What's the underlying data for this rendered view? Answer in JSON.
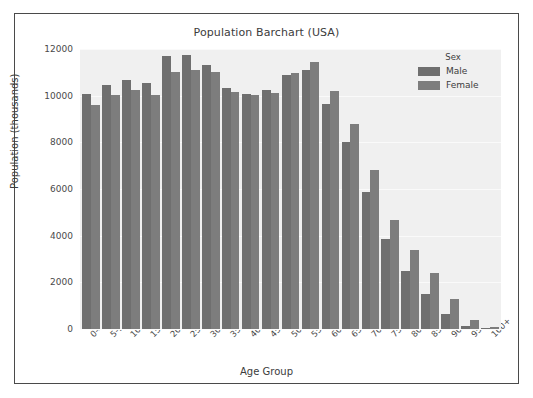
{
  "chart_data": {
    "type": "bar",
    "title": "Population Barchart (USA)",
    "xlabel": "Age Group",
    "ylabel": "Population (thousands)",
    "ylim": [
      0,
      12000
    ],
    "yticks": [
      0,
      2000,
      4000,
      6000,
      8000,
      10000,
      12000
    ],
    "ytick_labels": [
      "0",
      "2000",
      "4000",
      "6000",
      "8000",
      "10000",
      "12000"
    ],
    "grid": true,
    "legend": {
      "title": "Sex",
      "position": "upper right",
      "entries": [
        {
          "name": "Male",
          "color": "#6f6f6f"
        },
        {
          "name": "Female",
          "color": "#7d7d7d"
        }
      ]
    },
    "categories": [
      "0-4",
      "5-9",
      "10-14",
      "15-19",
      "20-24",
      "25-29",
      "30-34",
      "35-39",
      "40-44",
      "45-49",
      "50-54",
      "55-59",
      "60-64",
      "65-69",
      "70-74",
      "75-79",
      "80-84",
      "85-89",
      "90-94",
      "95-99",
      "100+"
    ],
    "series": [
      {
        "name": "Male",
        "color": "#6f6f6f",
        "values": [
          10060,
          10460,
          10660,
          10540,
          11700,
          11740,
          11320,
          10330,
          10080,
          10240,
          10880,
          11080,
          9650,
          8020,
          5870,
          3860,
          2480,
          1500,
          630,
          150,
          30
        ]
      },
      {
        "name": "Female",
        "color": "#7d7d7d",
        "values": [
          9620,
          10030,
          10230,
          10050,
          11020,
          11100,
          11020,
          10150,
          10050,
          10130,
          10960,
          11460,
          10210,
          8800,
          6820,
          4680,
          3400,
          2380,
          1280,
          370,
          80
        ]
      }
    ]
  }
}
